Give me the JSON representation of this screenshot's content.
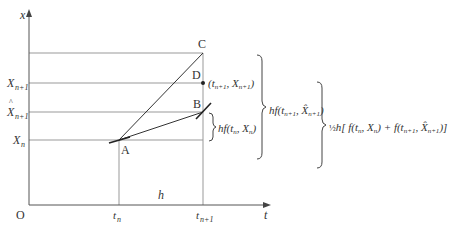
{
  "diagram": {
    "axes": {
      "y_label": "x",
      "x_label": "t",
      "origin": "O"
    },
    "y_ticks": [
      {
        "label": "X",
        "sub": "n+1",
        "hat": false
      },
      {
        "label": "X",
        "sub": "n+1",
        "hat": true
      },
      {
        "label": "X",
        "sub": "n",
        "hat": false
      }
    ],
    "x_ticks": [
      {
        "label": "t",
        "sub": "n"
      },
      {
        "label": "t",
        "sub": "n+1"
      }
    ],
    "step_label": "h",
    "points": {
      "A": "A",
      "B": "B",
      "C": "C",
      "D": "D"
    },
    "annotations": {
      "point_D": "(t_{n+1}, X_{n+1})",
      "brace_small": "hf(t_n, X_n)",
      "brace_large": "hf(t_{n+1}, X̂_{n+1})",
      "brace_outer": "½h[f(t_n, X_n) + f(t_{n+1}, X̂_{n+1})]"
    },
    "colors": {
      "grid": "#999999",
      "axis": "#555555",
      "line": "#333333",
      "text": "#333333"
    }
  }
}
